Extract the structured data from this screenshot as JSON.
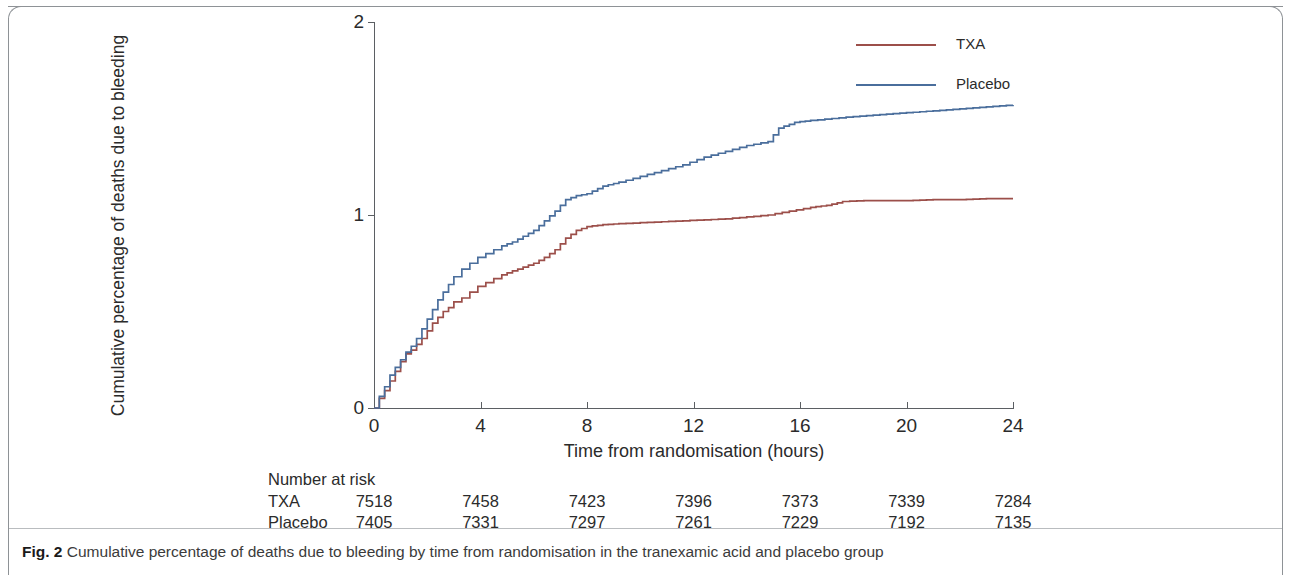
{
  "caption": {
    "label": "Fig. 2",
    "text": "Cumulative percentage of deaths due to bleeding by time from randomisation in the tranexamic acid and placebo group"
  },
  "legend": {
    "position": "top-right",
    "items": [
      {
        "label": "TXA",
        "color": "#9c4f4a"
      },
      {
        "label": "Placebo",
        "color": "#4a6e9c"
      }
    ]
  },
  "risk_table": {
    "title": "Number at risk",
    "rows": [
      {
        "label": "TXA",
        "values": [
          "7518",
          "7458",
          "7423",
          "7396",
          "7373",
          "7339",
          "7284"
        ]
      },
      {
        "label": "Placebo",
        "values": [
          "7405",
          "7331",
          "7297",
          "7261",
          "7229",
          "7192",
          "7135"
        ]
      }
    ]
  },
  "chart_data": {
    "type": "line",
    "title": "",
    "xlabel": "Time from randomisation (hours)",
    "ylabel": "Cumulative percentage of deaths due to bleeding",
    "xlim": [
      0,
      24
    ],
    "ylim": [
      0,
      2
    ],
    "xticks": [
      0,
      4,
      8,
      12,
      16,
      20,
      24
    ],
    "yticks": [
      0,
      1,
      2
    ],
    "grid": false,
    "step": "post",
    "series": [
      {
        "name": "TXA",
        "color": "#9c4f4a",
        "x": [
          0,
          0.2,
          0.4,
          0.6,
          0.8,
          1.0,
          1.2,
          1.4,
          1.6,
          1.8,
          2.0,
          2.2,
          2.4,
          2.6,
          2.8,
          3.0,
          3.3,
          3.6,
          3.9,
          4.2,
          4.5,
          4.8,
          5.2,
          5.6,
          6.0,
          6.4,
          6.8,
          7.2,
          7.6,
          8.0,
          8.6,
          9.2,
          10.0,
          10.8,
          11.6,
          12.4,
          13.2,
          14.0,
          14.8,
          15.6,
          16.4,
          17.0,
          17.6,
          18.4,
          19.2,
          20.0,
          21.0,
          22.0,
          23.0,
          24.0
        ],
        "y": [
          0.0,
          0.05,
          0.09,
          0.14,
          0.19,
          0.24,
          0.28,
          0.3,
          0.33,
          0.36,
          0.4,
          0.44,
          0.47,
          0.5,
          0.52,
          0.55,
          0.57,
          0.6,
          0.63,
          0.65,
          0.67,
          0.69,
          0.71,
          0.73,
          0.75,
          0.78,
          0.82,
          0.88,
          0.92,
          0.94,
          0.95,
          0.955,
          0.96,
          0.965,
          0.97,
          0.975,
          0.98,
          0.99,
          1.0,
          1.02,
          1.04,
          1.05,
          1.07,
          1.075,
          1.075,
          1.075,
          1.08,
          1.08,
          1.085,
          1.085
        ]
      },
      {
        "name": "Placebo",
        "color": "#4a6e9c",
        "x": [
          0,
          0.2,
          0.4,
          0.6,
          0.8,
          1.0,
          1.2,
          1.4,
          1.6,
          1.8,
          2.0,
          2.2,
          2.4,
          2.6,
          2.8,
          3.0,
          3.3,
          3.6,
          3.9,
          4.2,
          4.5,
          4.8,
          5.2,
          5.6,
          6.0,
          6.4,
          6.8,
          7.2,
          7.6,
          8.0,
          8.6,
          9.2,
          10.0,
          10.8,
          11.6,
          12.4,
          13.2,
          14.0,
          14.8,
          15.2,
          15.8,
          16.4,
          17.2,
          18.0,
          19.0,
          20.0,
          21.0,
          22.0,
          23.0,
          24.0
        ],
        "y": [
          0.0,
          0.06,
          0.11,
          0.17,
          0.21,
          0.25,
          0.29,
          0.32,
          0.36,
          0.41,
          0.46,
          0.51,
          0.56,
          0.6,
          0.64,
          0.68,
          0.72,
          0.75,
          0.78,
          0.8,
          0.82,
          0.84,
          0.86,
          0.89,
          0.92,
          0.97,
          1.02,
          1.08,
          1.1,
          1.11,
          1.15,
          1.17,
          1.2,
          1.23,
          1.26,
          1.3,
          1.33,
          1.36,
          1.38,
          1.45,
          1.48,
          1.49,
          1.5,
          1.51,
          1.52,
          1.53,
          1.54,
          1.55,
          1.56,
          1.57
        ]
      }
    ]
  }
}
